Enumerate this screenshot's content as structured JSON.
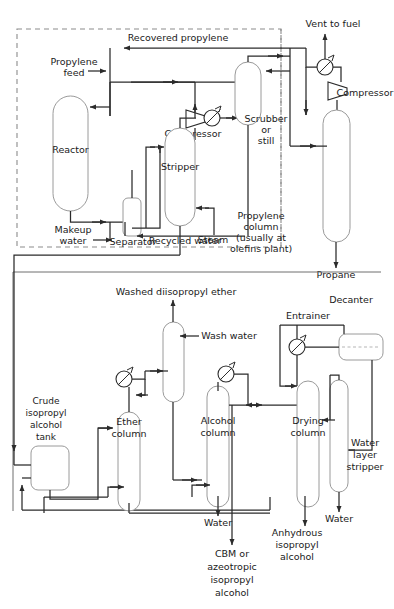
{
  "diagram": {
    "type": "process-flow-diagram",
    "width": 394,
    "height": 609,
    "background_color": "#ffffff",
    "pipe_color": "#2b2b2b",
    "vessel_outline_color": "#9a9a9a",
    "boundary_color": "#8c8c8c",
    "text_color": "#1a1a1a"
  },
  "sections": {
    "upper": {
      "name": "Hydration / propylene recovery section",
      "boundary_style": "dashed",
      "note": "Dashed battery-limit boundary around reaction section"
    },
    "lower": {
      "name": "Purification section",
      "boundary_style": "solid",
      "note": "Solid box around alcohol purification train"
    }
  },
  "labels": {
    "recovered_propylene": "Recovered propylene",
    "propylene_feed": "Propylene\nfeed",
    "propylene_feed_line1": "Propylene",
    "propylene_feed_line2": "feed",
    "reactor": "Reactor",
    "makeup_water_line1": "Makeup",
    "makeup_water_line2": "water",
    "separator": "Separator",
    "recycled_water": "Recycled water",
    "compressor_1": "Compressor",
    "stripper": "Stripper",
    "steam": "Steam",
    "scrubber_line1": "Scrubber",
    "scrubber_line2": "or",
    "scrubber_line3": "still",
    "vent_to_fuel": "Vent to fuel",
    "compressor_2": "Compressor",
    "propylene_column_line1": "Propylene",
    "propylene_column_line2": "column",
    "propylene_column_line3": "(usually at",
    "propylene_column_line4": "olefins plant)",
    "propane": "Propane",
    "washed_diisopropyl_ether": "Washed diisopropyl ether",
    "wash_water": "Wash water",
    "crude_tank_line1": "Crude",
    "crude_tank_line2": "isopropyl",
    "crude_tank_line3": "alcohol",
    "crude_tank_line4": "tank",
    "ether_column_line1": "Ether",
    "ether_column_line2": "column",
    "alcohol_column_line1": "Alcohol",
    "alcohol_column_line2": "column",
    "drying_column_line1": "Drying",
    "drying_column_line2": "column",
    "entrainer": "Entrainer",
    "decanter": "Decanter",
    "water_layer_stripper_line1": "Water",
    "water_layer_stripper_line2": "layer",
    "water_layer_stripper_line3": "stripper",
    "water_1": "Water",
    "water_2": "Water",
    "cbm_line1": "CBM or",
    "cbm_line2": "azeotropic",
    "cbm_line3": "isopropyl",
    "cbm_line4": "alcohol",
    "anhydrous_line1": "Anhydrous",
    "anhydrous_line2": "isopropyl",
    "anhydrous_line3": "alcohol"
  },
  "equipment": [
    {
      "id": "reactor",
      "name": "Reactor",
      "symbol": "vertical-vessel-rounded"
    },
    {
      "id": "separator",
      "name": "Separator",
      "symbol": "small-vertical-drum"
    },
    {
      "id": "stripper",
      "name": "Stripper",
      "symbol": "vertical-column"
    },
    {
      "id": "scrubber",
      "name": "Scrubber or still",
      "symbol": "vertical-vessel-rounded"
    },
    {
      "id": "compressor-1",
      "name": "Compressor",
      "symbol": "trapezoid-compressor"
    },
    {
      "id": "compressor-2",
      "name": "Compressor",
      "symbol": "trapezoid-compressor"
    },
    {
      "id": "propylene-column",
      "name": "Propylene column (usually at olefins plant)",
      "symbol": "vertical-column"
    },
    {
      "id": "crude-tank",
      "name": "Crude isopropyl alcohol tank",
      "symbol": "rounded-tank"
    },
    {
      "id": "ether-column",
      "name": "Ether column",
      "symbol": "vertical-column-domed"
    },
    {
      "id": "wash-column",
      "name": "Washed diisopropyl ether column",
      "symbol": "vertical-column"
    },
    {
      "id": "alcohol-column",
      "name": "Alcohol column",
      "symbol": "vertical-column-domed"
    },
    {
      "id": "drying-column",
      "name": "Drying column",
      "symbol": "vertical-column-domed"
    },
    {
      "id": "water-layer-stripper",
      "name": "Water layer stripper",
      "symbol": "vertical-column"
    },
    {
      "id": "decanter",
      "name": "Decanter",
      "symbol": "horizontal-drum"
    },
    {
      "id": "condenser-scrubber",
      "name": "Condenser",
      "symbol": "circle-heat-exchanger"
    },
    {
      "id": "condenser-ether",
      "name": "Condenser",
      "symbol": "circle-heat-exchanger"
    },
    {
      "id": "condenser-alcohol",
      "name": "Condenser",
      "symbol": "circle-heat-exchanger"
    },
    {
      "id": "condenser-drying",
      "name": "Condenser",
      "symbol": "circle-heat-exchanger"
    },
    {
      "id": "condenser-vent",
      "name": "Condenser",
      "symbol": "circle-heat-exchanger"
    }
  ],
  "streams": [
    {
      "id": "propylene-feed",
      "label": "Propylene feed",
      "direction": "in"
    },
    {
      "id": "makeup-water",
      "label": "Makeup water",
      "direction": "in"
    },
    {
      "id": "steam",
      "label": "Steam",
      "direction": "in"
    },
    {
      "id": "wash-water",
      "label": "Wash water",
      "direction": "in"
    },
    {
      "id": "entrainer",
      "label": "Entrainer",
      "direction": "in"
    },
    {
      "id": "recovered-propylene",
      "label": "Recovered propylene",
      "direction": "recycle"
    },
    {
      "id": "recycled-water",
      "label": "Recycled water",
      "direction": "recycle"
    },
    {
      "id": "vent-to-fuel",
      "label": "Vent to fuel",
      "direction": "out"
    },
    {
      "id": "propane",
      "label": "Propane",
      "direction": "out"
    },
    {
      "id": "washed-diisopropyl-ether",
      "label": "Washed diisopropyl ether",
      "direction": "out"
    },
    {
      "id": "water-out-alcohol",
      "label": "Water",
      "direction": "out"
    },
    {
      "id": "water-out-stripper",
      "label": "Water",
      "direction": "out"
    },
    {
      "id": "cbm-azeotropic",
      "label": "CBM or azeotropic isopropyl alcohol",
      "direction": "out"
    },
    {
      "id": "anhydrous-ipa",
      "label": "Anhydrous isopropyl alcohol",
      "direction": "out"
    }
  ]
}
